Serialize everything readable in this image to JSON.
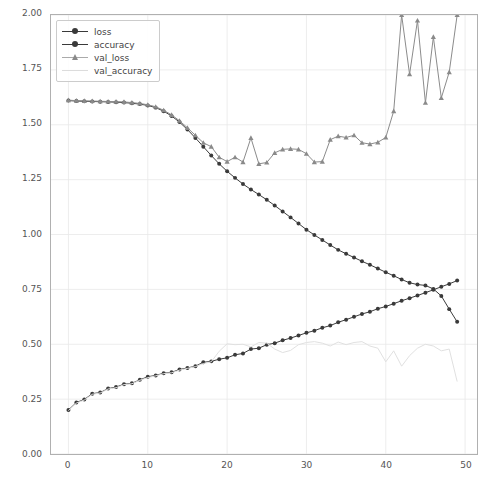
{
  "chart_data": {
    "type": "line",
    "title": "",
    "xlabel": "",
    "ylabel": "",
    "xlim": [
      -2.2,
      51.5
    ],
    "ylim": [
      0.0,
      2.0
    ],
    "grid": true,
    "legend_position": "upper left",
    "x": [
      0,
      1,
      2,
      3,
      4,
      5,
      6,
      7,
      8,
      9,
      10,
      11,
      12,
      13,
      14,
      15,
      16,
      17,
      18,
      19,
      20,
      21,
      22,
      23,
      24,
      25,
      26,
      27,
      28,
      29,
      30,
      31,
      32,
      33,
      34,
      35,
      36,
      37,
      38,
      39,
      40,
      41,
      42,
      43,
      44,
      45,
      46,
      47,
      48,
      49
    ],
    "xticks": [
      0,
      10,
      20,
      30,
      40,
      50
    ],
    "xtick_labels": [
      "0",
      "10",
      "20",
      "30",
      "40",
      "50"
    ],
    "yticks": [
      0.0,
      0.25,
      0.5,
      0.75,
      1.0,
      1.25,
      1.5,
      1.75,
      2.0
    ],
    "ytick_labels": [
      "0.00",
      "0.25",
      "0.50",
      "0.75",
      "1.00",
      "1.25",
      "1.50",
      "1.75",
      "2.00"
    ],
    "series": [
      {
        "name": "loss",
        "color": "#3a3a3a",
        "marker": "circle",
        "linewidth": 1.0,
        "values": [
          1.61,
          1.608,
          1.607,
          1.606,
          1.605,
          1.604,
          1.603,
          1.601,
          1.598,
          1.594,
          1.588,
          1.578,
          1.562,
          1.54,
          1.512,
          1.478,
          1.44,
          1.4,
          1.36,
          1.322,
          1.288,
          1.258,
          1.23,
          1.205,
          1.182,
          1.158,
          1.132,
          1.105,
          1.078,
          1.05,
          1.022,
          0.998,
          0.975,
          0.952,
          0.93,
          0.912,
          0.895,
          0.878,
          0.862,
          0.845,
          0.828,
          0.812,
          0.795,
          0.78,
          0.772,
          0.768,
          0.752,
          0.72,
          0.66,
          0.602
        ]
      },
      {
        "name": "accuracy",
        "color": "#3a3a3a",
        "marker": "circle",
        "linewidth": 1.0,
        "values": [
          0.2,
          0.235,
          0.248,
          0.275,
          0.28,
          0.298,
          0.305,
          0.318,
          0.322,
          0.338,
          0.352,
          0.358,
          0.368,
          0.372,
          0.385,
          0.392,
          0.4,
          0.418,
          0.422,
          0.432,
          0.438,
          0.452,
          0.458,
          0.478,
          0.482,
          0.498,
          0.505,
          0.518,
          0.528,
          0.54,
          0.552,
          0.562,
          0.575,
          0.585,
          0.6,
          0.612,
          0.625,
          0.638,
          0.648,
          0.662,
          0.672,
          0.685,
          0.698,
          0.71,
          0.722,
          0.735,
          0.748,
          0.762,
          0.775,
          0.79
        ]
      },
      {
        "name": "val_loss",
        "color": "#8a8a8a",
        "marker": "triangle",
        "linewidth": 1.0,
        "values": [
          1.612,
          1.61,
          1.609,
          1.608,
          1.607,
          1.606,
          1.605,
          1.604,
          1.601,
          1.597,
          1.591,
          1.582,
          1.566,
          1.545,
          1.518,
          1.486,
          1.452,
          1.418,
          1.4,
          1.352,
          1.332,
          1.352,
          1.33,
          1.44,
          1.322,
          1.328,
          1.372,
          1.388,
          1.39,
          1.388,
          1.368,
          1.33,
          1.332,
          1.432,
          1.448,
          1.442,
          1.452,
          1.418,
          1.412,
          1.42,
          1.442,
          1.562,
          2.0,
          1.73,
          1.975,
          1.6,
          1.9,
          1.622,
          1.74,
          2.0
        ]
      },
      {
        "name": "val_accuracy",
        "color": "#e0e0e0",
        "marker": "none",
        "linewidth": 1.0,
        "values": [
          0.198,
          0.232,
          0.246,
          0.272,
          0.278,
          0.296,
          0.302,
          0.316,
          0.32,
          0.336,
          0.348,
          0.356,
          0.366,
          0.37,
          0.382,
          0.39,
          0.398,
          0.412,
          0.42,
          0.468,
          0.502,
          0.498,
          0.5,
          0.488,
          0.508,
          0.505,
          0.478,
          0.462,
          0.472,
          0.498,
          0.508,
          0.512,
          0.505,
          0.492,
          0.51,
          0.498,
          0.508,
          0.512,
          0.492,
          0.482,
          0.42,
          0.47,
          0.4,
          0.448,
          0.482,
          0.5,
          0.492,
          0.47,
          0.478,
          0.33
        ]
      }
    ]
  },
  "legend": {
    "items": [
      {
        "label": "loss"
      },
      {
        "label": "accuracy"
      },
      {
        "label": "val_loss"
      },
      {
        "label": "val_accuracy"
      }
    ]
  },
  "axes": {
    "ytick_labels": [
      "0.00",
      "0.25",
      "0.50",
      "0.75",
      "1.00",
      "1.25",
      "1.50",
      "1.75",
      "2.00"
    ],
    "xtick_labels": [
      "0",
      "10",
      "20",
      "30",
      "40",
      "50"
    ]
  }
}
